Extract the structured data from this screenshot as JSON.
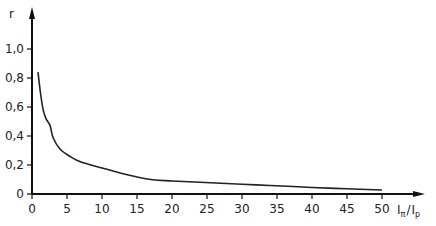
{
  "chart_data": {
    "type": "line",
    "title": "",
    "xlabel": {
      "main": "I",
      "sub1": "π",
      "sep": "/",
      "main2": "I",
      "sub2": "p"
    },
    "ylabel": "r",
    "xlim": [
      0,
      50
    ],
    "ylim": [
      0,
      1.0
    ],
    "grid": false,
    "legend": "none",
    "x_ticks": [
      0,
      5,
      10,
      15,
      20,
      25,
      30,
      35,
      40,
      45,
      50
    ],
    "x_tick_labels": [
      "0",
      "5",
      "10",
      "15",
      "20",
      "25",
      "30",
      "35",
      "40",
      "45",
      "50"
    ],
    "y_ticks": [
      0,
      0.2,
      0.4,
      0.6,
      0.8,
      1.0
    ],
    "y_tick_labels": [
      "0",
      "0,2",
      "0,4",
      "0,6",
      "0,8",
      "1,0"
    ],
    "series": [
      {
        "name": "r",
        "color": "#222222",
        "x": [
          0.86,
          1.2,
          1.6,
          2.0,
          2.6,
          3.0,
          4.0,
          5.4,
          7.0,
          10,
          13,
          17,
          20,
          24,
          30,
          34,
          40,
          45,
          50
        ],
        "y": [
          0.84,
          0.7,
          0.58,
          0.52,
          0.47,
          0.39,
          0.31,
          0.26,
          0.22,
          0.18,
          0.14,
          0.1,
          0.09,
          0.081,
          0.067,
          0.059,
          0.045,
          0.036,
          0.028
        ]
      }
    ]
  }
}
